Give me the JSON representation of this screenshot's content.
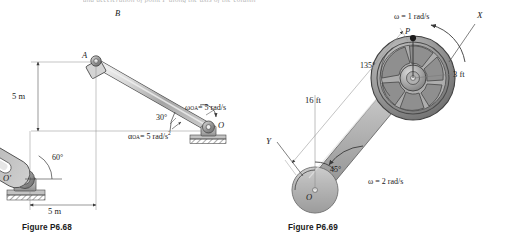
{
  "page": {
    "truncated_header_text": "and acceleration of point P along the axis of the column",
    "background_color": "#ffffff"
  },
  "figures": [
    {
      "id": "fig-p668",
      "caption": "Figure P6.68",
      "points": {
        "A": "A",
        "B": "B",
        "O_prime": "O'",
        "O": "O"
      },
      "dimensions": {
        "vertical": "5 m",
        "horizontal": "5 m"
      },
      "angles": {
        "lower_left": "60°",
        "bar_inclination": "30°"
      },
      "kinematics": {
        "omega_label": "ω",
        "omega_subscript": "OA",
        "omega_value": "= 5 rad/s",
        "alpha_label": "α",
        "alpha_subscript": "OA",
        "alpha_value": "= 5 rad/s",
        "alpha_exponent": "2"
      },
      "colors": {
        "link_fill": "#c9c9c9",
        "link_stroke": "#4a4a4a",
        "ground_fill": "#bdbdbd",
        "dimension_line": "#555555"
      }
    },
    {
      "id": "fig-p669",
      "caption": "Figure P6.69",
      "points": {
        "P": "P",
        "O": "O"
      },
      "axes": {
        "X": "X",
        "Y": "Y"
      },
      "dimensions": {
        "arm_length": "16 ft",
        "wheel_radius": "3 ft"
      },
      "angles": {
        "upper": "135°",
        "lower": "45°"
      },
      "kinematics": {
        "omega_wheel": "ω = 1 rad/s",
        "omega_arm": "ω = 2 rad/s"
      },
      "colors": {
        "arm_fill": "#b9b9b9",
        "arm_stroke": "#5a5a5a",
        "wheel_fill": "#9a9a9a",
        "wheel_stroke": "#4a4a4a"
      }
    }
  ]
}
